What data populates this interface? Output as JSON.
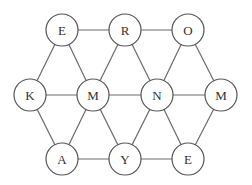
{
  "diagram": {
    "type": "letter-grid-graph",
    "node_radius": 16,
    "nodes": [
      {
        "id": "n1",
        "label": "E",
        "x": 62,
        "y": 30
      },
      {
        "id": "n2",
        "label": "R",
        "x": 125,
        "y": 30
      },
      {
        "id": "n3",
        "label": "O",
        "x": 188,
        "y": 30
      },
      {
        "id": "n4",
        "label": "K",
        "x": 30,
        "y": 95
      },
      {
        "id": "n5",
        "label": "M",
        "x": 93,
        "y": 95
      },
      {
        "id": "n6",
        "label": "N",
        "x": 157,
        "y": 95
      },
      {
        "id": "n7",
        "label": "M",
        "x": 221,
        "y": 95
      },
      {
        "id": "n8",
        "label": "A",
        "x": 62,
        "y": 159
      },
      {
        "id": "n9",
        "label": "Y",
        "x": 125,
        "y": 159
      },
      {
        "id": "n10",
        "label": "E",
        "x": 188,
        "y": 159
      }
    ],
    "edges": [
      [
        "n1",
        "n2"
      ],
      [
        "n2",
        "n3"
      ],
      [
        "n4",
        "n5"
      ],
      [
        "n5",
        "n6"
      ],
      [
        "n6",
        "n7"
      ],
      [
        "n8",
        "n9"
      ],
      [
        "n9",
        "n10"
      ],
      [
        "n1",
        "n4"
      ],
      [
        "n1",
        "n5"
      ],
      [
        "n2",
        "n5"
      ],
      [
        "n2",
        "n6"
      ],
      [
        "n3",
        "n6"
      ],
      [
        "n3",
        "n7"
      ],
      [
        "n4",
        "n8"
      ],
      [
        "n5",
        "n8"
      ],
      [
        "n5",
        "n9"
      ],
      [
        "n6",
        "n9"
      ],
      [
        "n6",
        "n10"
      ],
      [
        "n7",
        "n10"
      ]
    ]
  }
}
